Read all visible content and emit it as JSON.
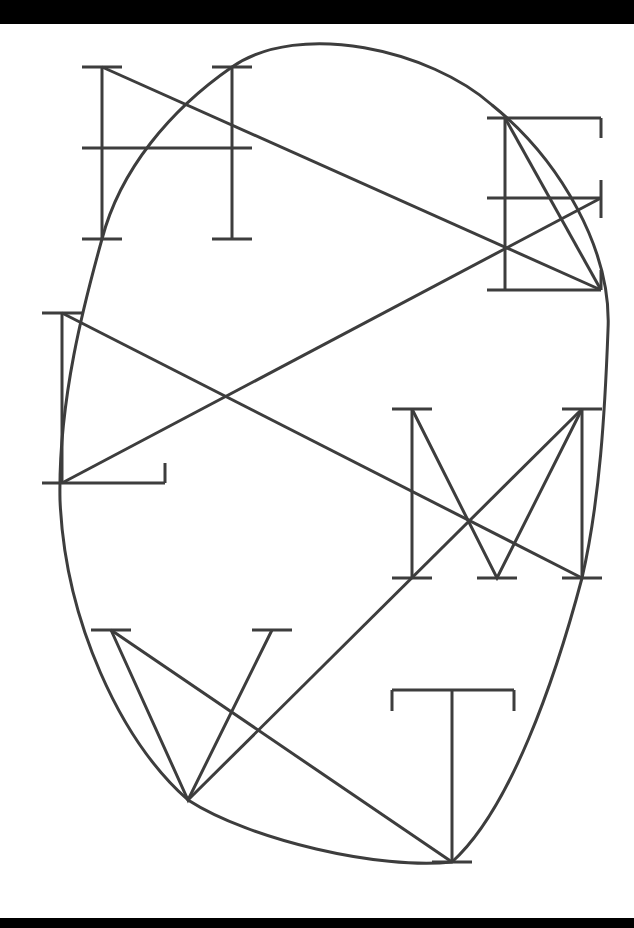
{
  "figure": {
    "letters": [
      "H",
      "E",
      "L",
      "M",
      "W",
      "T"
    ],
    "colors": {
      "stroke": "#3d3d3d",
      "background": "#ffffff",
      "frame_bars": "#000000"
    }
  }
}
